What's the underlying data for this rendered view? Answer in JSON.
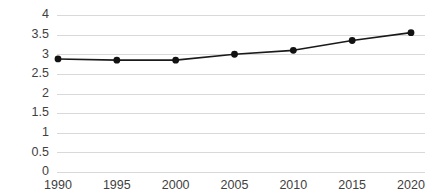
{
  "chart_data": {
    "type": "line",
    "title": "",
    "subtitle": "",
    "xlabel": "",
    "ylabel": "",
    "categories": [
      "1990",
      "1995",
      "2000",
      "2005",
      "2010",
      "2015",
      "2020"
    ],
    "x": [
      1990,
      1995,
      2000,
      2005,
      2010,
      2015,
      2020
    ],
    "values": [
      2.88,
      2.85,
      2.85,
      3.0,
      3.1,
      3.35,
      3.55
    ],
    "series": [
      {
        "name": "",
        "values": [
          2.88,
          2.85,
          2.85,
          3.0,
          3.1,
          3.35,
          3.55
        ]
      }
    ],
    "ylim": [
      0,
      4
    ],
    "xlim": [
      1990,
      2020
    ],
    "ytick_labels": [
      "0",
      "0.5",
      "1",
      "1.5",
      "2",
      "2.5",
      "3",
      "3.5",
      "4"
    ],
    "ytick_values": [
      0,
      0.5,
      1,
      1.5,
      2,
      2.5,
      3,
      3.5,
      4
    ],
    "xtick_labels": [
      "1990",
      "1995",
      "2000",
      "2005",
      "2010",
      "2015",
      "2020"
    ],
    "grid": "horizontal",
    "legend": "none",
    "marker": "circle",
    "colors": {
      "line": "#1a1a1a",
      "marker": "#121212",
      "gridline": "#d9d9d9",
      "tick_label": "#3f3f3f",
      "background": "#ffffff"
    }
  }
}
